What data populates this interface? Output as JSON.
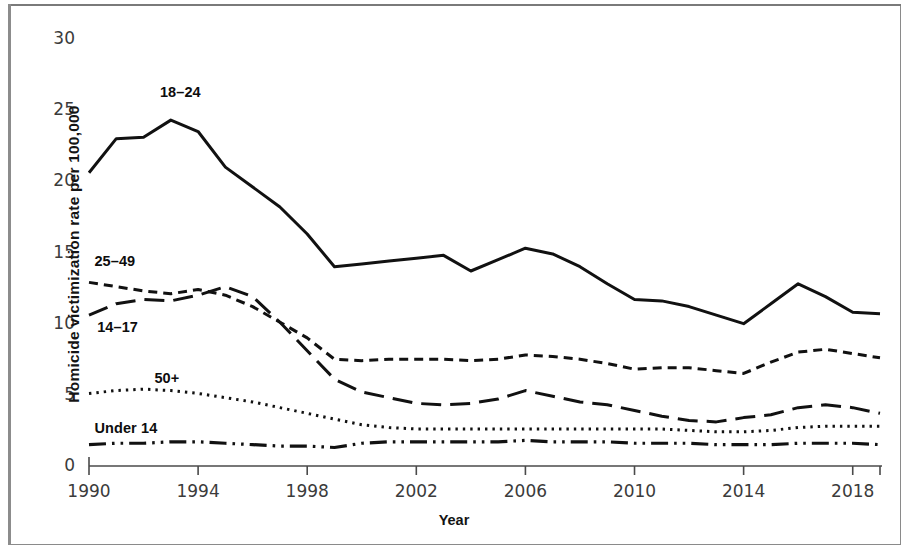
{
  "chart_data": {
    "type": "line",
    "title": "",
    "subtitle": "",
    "xlabel": "Year",
    "ylabel": "Homicide victimization rate per 100,000",
    "xlim": [
      1990,
      2019
    ],
    "ylim": [
      0,
      30
    ],
    "grid": false,
    "legend_position": "inline-annotations",
    "x": [
      1990,
      1991,
      1992,
      1993,
      1994,
      1995,
      1996,
      1997,
      1998,
      1999,
      2000,
      2001,
      2002,
      2003,
      2004,
      2005,
      2006,
      2007,
      2008,
      2009,
      2010,
      2011,
      2012,
      2013,
      2014,
      2015,
      2016,
      2017,
      2018,
      2019
    ],
    "xticks": [
      1990,
      1994,
      1998,
      2002,
      2006,
      2010,
      2014,
      2018
    ],
    "yticks": [
      0,
      5,
      10,
      15,
      20,
      25,
      30
    ],
    "series": [
      {
        "name": "18–24",
        "style": "solid",
        "label_x": 1992.6,
        "label_y": 26.2,
        "values": [
          20.6,
          23.0,
          23.1,
          24.3,
          23.5,
          21.0,
          19.6,
          18.2,
          16.3,
          14.0,
          14.2,
          14.4,
          14.6,
          14.8,
          13.7,
          14.5,
          15.3,
          14.9,
          14.0,
          12.8,
          11.7,
          11.6,
          11.2,
          10.6,
          10.0,
          11.4,
          12.8,
          11.9,
          10.8,
          10.7
        ]
      },
      {
        "name": "25–49",
        "style": "dashed-short",
        "label_x": 1990.2,
        "label_y": 14.3,
        "values": [
          12.9,
          12.6,
          12.3,
          12.1,
          12.4,
          12.0,
          11.2,
          10.1,
          9.0,
          7.5,
          7.4,
          7.5,
          7.5,
          7.5,
          7.4,
          7.5,
          7.8,
          7.7,
          7.5,
          7.2,
          6.8,
          6.9,
          6.9,
          6.7,
          6.5,
          7.3,
          8.0,
          8.2,
          7.9,
          7.6
        ]
      },
      {
        "name": "14–17",
        "style": "dashed-long",
        "label_x": 1990.3,
        "label_y": 9.7,
        "values": [
          10.6,
          11.4,
          11.7,
          11.6,
          12.0,
          12.6,
          11.9,
          10.1,
          8.1,
          6.1,
          5.2,
          4.8,
          4.4,
          4.3,
          4.4,
          4.7,
          5.3,
          4.9,
          4.5,
          4.3,
          3.9,
          3.5,
          3.2,
          3.1,
          3.4,
          3.6,
          4.1,
          4.3,
          4.1,
          3.7
        ]
      },
      {
        "name": "50+",
        "style": "dotted",
        "label_x": 1992.4,
        "label_y": 6.1,
        "values": [
          5.1,
          5.3,
          5.4,
          5.3,
          5.1,
          4.8,
          4.5,
          4.1,
          3.7,
          3.3,
          2.9,
          2.7,
          2.6,
          2.6,
          2.6,
          2.6,
          2.6,
          2.6,
          2.6,
          2.6,
          2.6,
          2.6,
          2.5,
          2.4,
          2.4,
          2.5,
          2.7,
          2.8,
          2.8,
          2.8
        ]
      },
      {
        "name": "Under 14",
        "style": "dash-dot-dot",
        "label_x": 1990.2,
        "label_y": 2.6,
        "values": [
          1.5,
          1.6,
          1.6,
          1.7,
          1.7,
          1.6,
          1.5,
          1.4,
          1.4,
          1.3,
          1.6,
          1.7,
          1.7,
          1.7,
          1.7,
          1.7,
          1.8,
          1.7,
          1.7,
          1.7,
          1.6,
          1.6,
          1.6,
          1.5,
          1.5,
          1.5,
          1.6,
          1.6,
          1.6,
          1.5
        ]
      }
    ]
  },
  "axis": {
    "ylabel": "Homicide victimization rate per 100,000",
    "xlabel": "Year"
  },
  "colors": {
    "line": "#111111",
    "axis": "#4a4a4a",
    "tick_text": "#3b3b3b",
    "background": "#ffffff",
    "frame": "#8a8a8a"
  }
}
